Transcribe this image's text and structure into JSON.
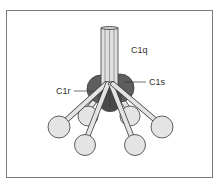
{
  "figure": {
    "labels": {
      "c1q": "C1q",
      "c1s": "C1s",
      "c1r": "C1r"
    },
    "colors": {
      "heads": "#e4e4e4",
      "stalk": "#e0e0e0",
      "protease": "#5e5e5e",
      "outline": "#3a3a3a"
    }
  }
}
